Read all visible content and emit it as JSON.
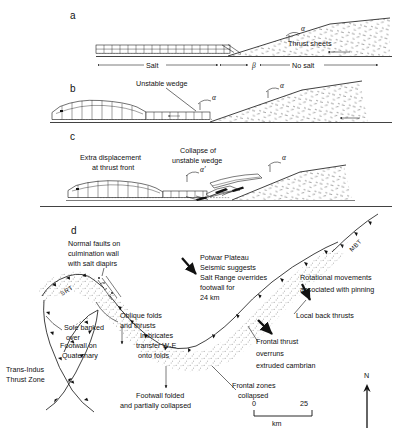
{
  "figure": {
    "title_letters": {
      "a": "a",
      "b": "b",
      "c": "c",
      "d": "d"
    }
  },
  "panel_a": {
    "letter": "a",
    "labels": {
      "alpha": "α",
      "thrust_sheets": "Thrust sheets",
      "salt": "Salt",
      "beta": "β",
      "no_salt": "No salt"
    }
  },
  "panel_b": {
    "letter": "b",
    "labels": {
      "unstable_wedge": "Unstable wedge",
      "alpha_1": "α",
      "alpha_2": "α"
    }
  },
  "panel_c": {
    "letter": "c",
    "labels": {
      "extra_displacement_line1": "Extra displacement",
      "extra_displacement_line2": "at thrust front",
      "collapse_line1": "Collapse of",
      "collapse_line2": "unstable wedge",
      "alpha": "α",
      "alpha_prime": "α′"
    }
  },
  "panel_d": {
    "letter": "d",
    "annotations": {
      "normal_faults_line1": "Normal faults on",
      "normal_faults_line2": "culmination wall",
      "normal_faults_line3": "with salt diapirs",
      "oblique_folds_line1": "Oblique folds",
      "oblique_folds_line2": "and thrusts",
      "sole_banked_line1": "Sole banked",
      "sole_banked_line2": "over",
      "footwall_quaternary_line1": "Footwall on",
      "footwall_quaternary_line2": "Quaternary",
      "trans_indus_line1": "Trans-Indus",
      "trans_indus_line2": "Thrust Zone",
      "imbricates_line1": "Imbricates",
      "imbricates_line2": "transfer W-E",
      "imbricates_line3": "onto folds",
      "footwall_folded_line1": "Footwall folded",
      "footwall_folded_line2": "and partially collapsed",
      "potwar_line1": "Potwar Plateau",
      "potwar_line2": "Seismic suggests",
      "potwar_line3": "Salt Range overrides",
      "potwar_line4": "footwall for",
      "potwar_line5": "24 km",
      "frontal_zones_line1": "Frontal zones",
      "frontal_zones_line2": "collapsed",
      "frontal_thrust_line1": "Frontal thrust",
      "frontal_thrust_line2": "overruns",
      "frontal_thrust_line3": "extruded cambrian",
      "rotational_line1": "Rotational movements",
      "rotational_line2": "associated with pinning",
      "local_back_thrusts": "Local back thrusts"
    },
    "fault_labels": {
      "srt": "SRT",
      "mbt": "MBT"
    },
    "scale": {
      "min": "0",
      "max": "25",
      "unit": "km"
    },
    "north": "N"
  },
  "colors": {
    "ink": "#111111",
    "paper": "#ffffff"
  }
}
